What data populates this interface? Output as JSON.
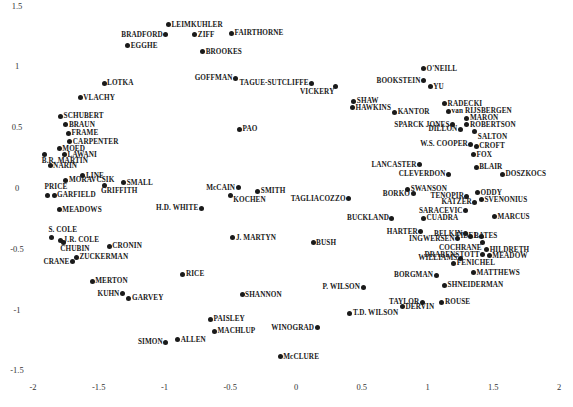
{
  "chart_data": {
    "type": "scatter",
    "title": "",
    "xlabel": "",
    "ylabel": "",
    "xlim": [
      -2,
      2
    ],
    "ylim": [
      -1.5,
      1.5
    ],
    "grid": false,
    "legend": null,
    "x_ticks": [
      "-2",
      "-1.5",
      "-1",
      "-0.5",
      "0",
      "0.5",
      "1",
      "1.5",
      "2"
    ],
    "y_ticks": [
      "1.5",
      "1",
      "0.5",
      "0",
      "-0.5",
      "-1",
      "-1.5"
    ],
    "points": [
      {
        "label": "LEIMKUHLER",
        "x": -0.97,
        "y": 1.35,
        "pos": "right"
      },
      {
        "label": "BRADFORD",
        "x": -0.99,
        "y": 1.27,
        "pos": "left"
      },
      {
        "label": "ZIFF",
        "x": -0.77,
        "y": 1.27,
        "pos": "right"
      },
      {
        "label": "FAIRTHORNE",
        "x": -0.49,
        "y": 1.28,
        "pos": "right"
      },
      {
        "label": "EGGHE",
        "x": -1.28,
        "y": 1.18,
        "pos": "right"
      },
      {
        "label": "BROOKES",
        "x": -0.71,
        "y": 1.13,
        "pos": "right"
      },
      {
        "label": "LOTKA",
        "x": -1.46,
        "y": 0.87,
        "pos": "right"
      },
      {
        "label": "GOFFMAN",
        "x": -0.46,
        "y": 0.91,
        "pos": "left"
      },
      {
        "label": "TAGUE-SUTCLIFFE",
        "x": 0.12,
        "y": 0.87,
        "pos": "left"
      },
      {
        "label": "VICKERY",
        "x": 0.3,
        "y": 0.84,
        "pos": "belowleft"
      },
      {
        "label": "O'NEILL",
        "x": 0.97,
        "y": 0.99,
        "pos": "right"
      },
      {
        "label": "BOOKSTEIN",
        "x": 0.97,
        "y": 0.89,
        "pos": "left"
      },
      {
        "label": "YU",
        "x": 1.02,
        "y": 0.84,
        "pos": "right"
      },
      {
        "label": "VLACHY",
        "x": -1.64,
        "y": 0.75,
        "pos": "right"
      },
      {
        "label": "SHAW",
        "x": 0.44,
        "y": 0.72,
        "pos": "right"
      },
      {
        "label": "HAWKINS",
        "x": 0.43,
        "y": 0.67,
        "pos": "right"
      },
      {
        "label": "KANTOR",
        "x": 0.75,
        "y": 0.63,
        "pos": "right"
      },
      {
        "label": "RADECKI",
        "x": 1.13,
        "y": 0.7,
        "pos": "right"
      },
      {
        "label": "van RIJSBERGEN",
        "x": 1.16,
        "y": 0.64,
        "pos": "right"
      },
      {
        "label": "SCHUBERT",
        "x": -1.79,
        "y": 0.6,
        "pos": "right"
      },
      {
        "label": "MARON",
        "x": 1.3,
        "y": 0.58,
        "pos": "right"
      },
      {
        "label": "SPARCK JONES",
        "x": 1.19,
        "y": 0.53,
        "pos": "left"
      },
      {
        "label": "ROBERTSON",
        "x": 1.3,
        "y": 0.53,
        "pos": "right"
      },
      {
        "label": "DILLON",
        "x": 1.25,
        "y": 0.49,
        "pos": "left"
      },
      {
        "label": "SALTON",
        "x": 1.36,
        "y": 0.47,
        "pos": "belowright"
      },
      {
        "label": "BRAUN",
        "x": -1.75,
        "y": 0.53,
        "pos": "right"
      },
      {
        "label": "PAO",
        "x": -0.43,
        "y": 0.49,
        "pos": "right"
      },
      {
        "label": "FRAME",
        "x": -1.73,
        "y": 0.46,
        "pos": "right"
      },
      {
        "label": "CARPENTER",
        "x": -1.72,
        "y": 0.39,
        "pos": "right"
      },
      {
        "label": "W.S. COOPER",
        "x": 1.33,
        "y": 0.37,
        "pos": "left"
      },
      {
        "label": "CROFT",
        "x": 1.37,
        "y": 0.35,
        "pos": "right"
      },
      {
        "label": "MOED",
        "x": -1.8,
        "y": 0.33,
        "pos": "right"
      },
      {
        "label": "LAWANI",
        "x": -1.76,
        "y": 0.28,
        "pos": "right"
      },
      {
        "label": "B.R. MARTIN",
        "x": -1.91,
        "y": 0.28,
        "pos": "below"
      },
      {
        "label": "FOX",
        "x": 1.35,
        "y": 0.28,
        "pos": "right"
      },
      {
        "label": "NARIN",
        "x": -1.87,
        "y": 0.19,
        "pos": "right"
      },
      {
        "label": "LANCASTER",
        "x": 0.94,
        "y": 0.2,
        "pos": "left"
      },
      {
        "label": "BLAIR",
        "x": 1.37,
        "y": 0.18,
        "pos": "right"
      },
      {
        "label": "CLEVERDON",
        "x": 1.16,
        "y": 0.12,
        "pos": "left"
      },
      {
        "label": "DOSZKOCS",
        "x": 1.57,
        "y": 0.12,
        "pos": "right"
      },
      {
        "label": "LINE",
        "x": -1.62,
        "y": 0.11,
        "pos": "right"
      },
      {
        "label": "MORAVCSIK",
        "x": -1.75,
        "y": 0.07,
        "pos": "right"
      },
      {
        "label": "SMALL",
        "x": -1.31,
        "y": 0.05,
        "pos": "right"
      },
      {
        "label": "GRIFFITH",
        "x": -1.46,
        "y": 0.03,
        "pos": "below"
      },
      {
        "label": "McCAIN",
        "x": -0.44,
        "y": 0.01,
        "pos": "left"
      },
      {
        "label": "PRICE",
        "x": -1.89,
        "y": -0.05,
        "pos": "above"
      },
      {
        "label": "GARFIELD",
        "x": -1.84,
        "y": -0.05,
        "pos": "right"
      },
      {
        "label": "SMITH",
        "x": -0.29,
        "y": -0.02,
        "pos": "right"
      },
      {
        "label": "KOCHEN",
        "x": -0.5,
        "y": -0.05,
        "pos": "belowright"
      },
      {
        "label": "SWANSON",
        "x": 0.85,
        "y": 0.0,
        "pos": "right"
      },
      {
        "label": "BORKO",
        "x": 0.89,
        "y": -0.04,
        "pos": "left"
      },
      {
        "label": "ODDY",
        "x": 1.38,
        "y": -0.03,
        "pos": "right"
      },
      {
        "label": "TENOPIR",
        "x": 1.3,
        "y": -0.06,
        "pos": "left"
      },
      {
        "label": "SVENONIUS",
        "x": 1.41,
        "y": -0.09,
        "pos": "right"
      },
      {
        "label": "KATZER",
        "x": 1.36,
        "y": -0.11,
        "pos": "left"
      },
      {
        "label": "TAGLIACOZZO",
        "x": 0.4,
        "y": -0.08,
        "pos": "left"
      },
      {
        "label": "H.D. WHITE",
        "x": -0.72,
        "y": -0.16,
        "pos": "left"
      },
      {
        "label": "MEADOWS",
        "x": -1.8,
        "y": -0.17,
        "pos": "right"
      },
      {
        "label": "BUCKLAND",
        "x": 0.73,
        "y": -0.24,
        "pos": "left"
      },
      {
        "label": "SARACEVIC",
        "x": 1.29,
        "y": -0.18,
        "pos": "left"
      },
      {
        "label": "CUADRA",
        "x": 0.97,
        "y": -0.24,
        "pos": "right"
      },
      {
        "label": "MARCUS",
        "x": 1.51,
        "y": -0.23,
        "pos": "right"
      },
      {
        "label": "S. COLE",
        "x": -1.86,
        "y": -0.4,
        "pos": "above"
      },
      {
        "label": "J.R. COLE",
        "x": -1.79,
        "y": -0.42,
        "pos": "right"
      },
      {
        "label": "HARTER",
        "x": 0.95,
        "y": -0.35,
        "pos": "left"
      },
      {
        "label": "BELKIN",
        "x": 1.29,
        "y": -0.37,
        "pos": "left"
      },
      {
        "label": "BATES",
        "x": 1.33,
        "y": -0.39,
        "pos": "right"
      },
      {
        "label": "FIDEL",
        "x": 1.41,
        "y": -0.39,
        "pos": "left"
      },
      {
        "label": "COCHRANE",
        "x": 1.42,
        "y": -0.44,
        "pos": "belowleft"
      },
      {
        "label": "CHUBIN",
        "x": -1.77,
        "y": -0.44,
        "pos": "below"
      },
      {
        "label": "INGWERSEN",
        "x": 1.23,
        "y": -0.41,
        "pos": "left"
      },
      {
        "label": "J. MARTYN",
        "x": -0.48,
        "y": -0.4,
        "pos": "right"
      },
      {
        "label": "CRONIN",
        "x": -1.42,
        "y": -0.47,
        "pos": "right"
      },
      {
        "label": "BUSH",
        "x": 0.13,
        "y": -0.44,
        "pos": "right"
      },
      {
        "label": "HILDRETH",
        "x": 1.45,
        "y": -0.5,
        "pos": "right"
      },
      {
        "label": "DRABENSTOTT",
        "x": 1.42,
        "y": -0.54,
        "pos": "left"
      },
      {
        "label": "MEADOW",
        "x": 1.47,
        "y": -0.55,
        "pos": "right"
      },
      {
        "label": "ZUCKERMAN",
        "x": -1.67,
        "y": -0.56,
        "pos": "right"
      },
      {
        "label": "CRANE",
        "x": -1.7,
        "y": -0.6,
        "pos": "left"
      },
      {
        "label": "WILLIAMS",
        "x": 1.25,
        "y": -0.57,
        "pos": "left"
      },
      {
        "label": "FENICHEL",
        "x": 1.2,
        "y": -0.61,
        "pos": "right"
      },
      {
        "label": "MATTHEWS",
        "x": 1.35,
        "y": -0.69,
        "pos": "right"
      },
      {
        "label": "RICE",
        "x": -0.86,
        "y": -0.7,
        "pos": "right"
      },
      {
        "label": "BORGMAN",
        "x": 1.065,
        "y": -0.71,
        "pos": "left"
      },
      {
        "label": "SHNEIDERMAN",
        "x": 1.13,
        "y": -0.79,
        "pos": "right"
      },
      {
        "label": "MERTON",
        "x": -1.55,
        "y": -0.76,
        "pos": "right"
      },
      {
        "label": "P. WILSON",
        "x": 0.51,
        "y": -0.81,
        "pos": "left"
      },
      {
        "label": "KUHN",
        "x": -1.32,
        "y": -0.86,
        "pos": "left"
      },
      {
        "label": "SHANNON",
        "x": -0.41,
        "y": -0.87,
        "pos": "right"
      },
      {
        "label": "GARVEY",
        "x": -1.27,
        "y": -0.9,
        "pos": "right"
      },
      {
        "label": "TAYLOR",
        "x": 0.96,
        "y": -0.93,
        "pos": "left"
      },
      {
        "label": "ROUSE",
        "x": 1.11,
        "y": -0.93,
        "pos": "right"
      },
      {
        "label": "DERVIN",
        "x": 0.81,
        "y": -0.97,
        "pos": "right"
      },
      {
        "label": "T.D. WILSON",
        "x": 0.41,
        "y": -1.02,
        "pos": "right"
      },
      {
        "label": "PAISLEY",
        "x": -0.65,
        "y": -1.07,
        "pos": "right"
      },
      {
        "label": "MACHLUP",
        "x": -0.62,
        "y": -1.17,
        "pos": "right"
      },
      {
        "label": "WINOGRAD",
        "x": 0.16,
        "y": -1.14,
        "pos": "left"
      },
      {
        "label": "SIMON",
        "x": -0.99,
        "y": -1.26,
        "pos": "left"
      },
      {
        "label": "ALLEN",
        "x": -0.9,
        "y": -1.24,
        "pos": "right"
      },
      {
        "label": "McCLURE",
        "x": -0.12,
        "y": -1.38,
        "pos": "right"
      }
    ]
  },
  "layout": {
    "x_origin_px": 296,
    "y_origin_px": 189,
    "x_scale_px": 131.5,
    "y_scale_px": 121.6
  }
}
